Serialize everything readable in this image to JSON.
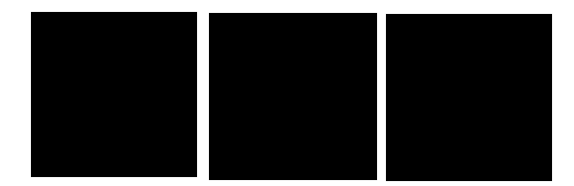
{
  "background_color": "#ffffff",
  "panels": [
    {
      "color": "#000000",
      "left": 31,
      "top": 12,
      "width": 166,
      "height": 165
    },
    {
      "color": "#000000",
      "left": 209,
      "top": 13,
      "width": 168,
      "height": 167
    },
    {
      "color": "#000000",
      "left": 386,
      "top": 14,
      "width": 166,
      "height": 167
    }
  ]
}
